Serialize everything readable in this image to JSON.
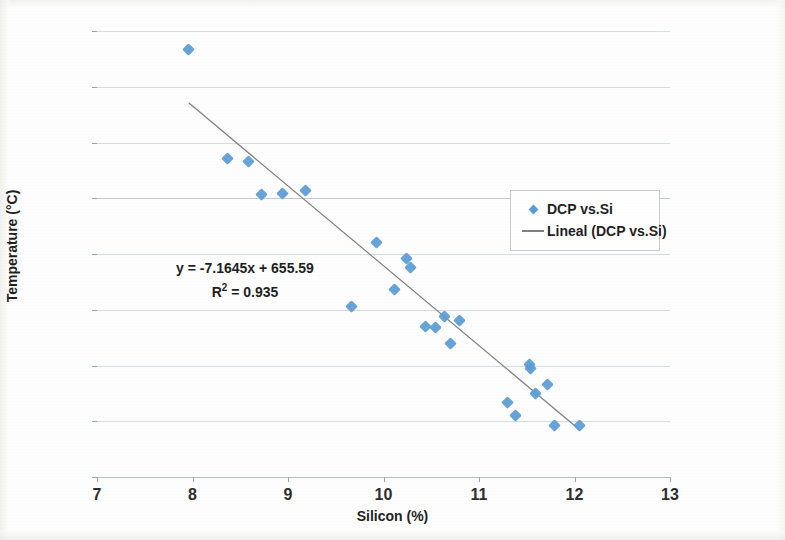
{
  "chart_data": {
    "type": "scatter",
    "title": "",
    "xlabel": "Silicon (%)",
    "ylabel": "Temperature (°C)",
    "xlim": [
      7,
      13
    ],
    "ylim": [
      565,
      605
    ],
    "xticks": [
      7,
      8,
      9,
      10,
      11,
      12,
      13
    ],
    "yticks": [
      565,
      570,
      575,
      580,
      585,
      590,
      595,
      600,
      605
    ],
    "grid": true,
    "legend_position": "right-center",
    "series": [
      {
        "name": "DCP vs.Si",
        "type": "scatter",
        "color": "#5b9bd5",
        "marker": "diamond",
        "points": [
          [
            7.96,
            603.3
          ],
          [
            8.37,
            593.6
          ],
          [
            8.59,
            593.3
          ],
          [
            8.72,
            590.3
          ],
          [
            8.94,
            590.4
          ],
          [
            9.18,
            590.7
          ],
          [
            9.67,
            580.3
          ],
          [
            9.93,
            586.0
          ],
          [
            10.11,
            581.8
          ],
          [
            10.24,
            584.6
          ],
          [
            10.28,
            583.8
          ],
          [
            10.44,
            578.5
          ],
          [
            10.54,
            578.4
          ],
          [
            10.64,
            579.4
          ],
          [
            10.7,
            577.0
          ],
          [
            10.8,
            579.0
          ],
          [
            11.3,
            571.7
          ],
          [
            11.38,
            570.5
          ],
          [
            11.53,
            575.1
          ],
          [
            11.54,
            574.7
          ],
          [
            11.59,
            572.5
          ],
          [
            11.72,
            573.3
          ],
          [
            11.79,
            569.6
          ],
          [
            12.05,
            569.6
          ]
        ]
      },
      {
        "name": "Lineal (DCP vs.Si)",
        "type": "line",
        "color": "#7f7f7f",
        "fit": "linear",
        "slope": -7.1645,
        "intercept": 655.59,
        "r_squared": 0.935,
        "x_range": [
          7.96,
          12.05
        ]
      }
    ],
    "annotations": {
      "equation": "y = -7.1645x + 655.59",
      "r_squared_label": "R² = 0.935",
      "r_squared_prefix": "R",
      "r_squared_exp": "2",
      "r_squared_value": "= 0.935"
    }
  },
  "legend": {
    "entries": [
      {
        "label": "DCP vs.Si",
        "marker": "diamond",
        "color": "#5b9bd5"
      },
      {
        "label": "Lineal (DCP vs.Si)",
        "marker": "line",
        "color": "#7f7f7f"
      }
    ]
  },
  "colors": {
    "marker": "#5b9bd5",
    "trendline": "#7f7f7f",
    "gridline": "#d6dce5",
    "text": "#1f1f1f",
    "page_background": "#fdfdfd"
  }
}
